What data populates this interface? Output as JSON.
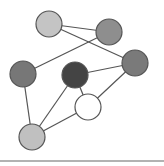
{
  "diagram": {
    "type": "network-graph",
    "nodes": [
      {
        "id": "n1",
        "x": 49,
        "y": 24,
        "r": 13,
        "fill": "#c4c4c4"
      },
      {
        "id": "n2",
        "x": 109,
        "y": 32,
        "r": 13,
        "fill": "#8e8e8e"
      },
      {
        "id": "n3",
        "x": 135,
        "y": 63,
        "r": 13,
        "fill": "#7a7a7a"
      },
      {
        "id": "n4",
        "x": 23,
        "y": 74,
        "r": 13,
        "fill": "#777777"
      },
      {
        "id": "n5",
        "x": 75,
        "y": 75,
        "r": 13,
        "fill": "#444444"
      },
      {
        "id": "n6",
        "x": 88,
        "y": 107,
        "r": 13,
        "fill": "#ffffff"
      },
      {
        "id": "n7",
        "x": 32,
        "y": 137,
        "r": 13,
        "fill": "#c0c0c0"
      }
    ],
    "edges": [
      [
        "n1",
        "n2"
      ],
      [
        "n1",
        "n3"
      ],
      [
        "n2",
        "n4"
      ],
      [
        "n3",
        "n5"
      ],
      [
        "n3",
        "n6"
      ],
      [
        "n5",
        "n6"
      ],
      [
        "n4",
        "n7"
      ],
      [
        "n5",
        "n7"
      ],
      [
        "n6",
        "n7"
      ]
    ],
    "stroke": "#555555",
    "baseline": {
      "x1": 0,
      "y1": 161,
      "x2": 164,
      "y2": 161,
      "color": "#999999"
    }
  }
}
